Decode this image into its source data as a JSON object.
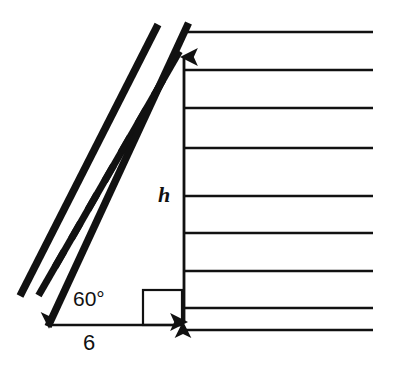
{
  "figure": {
    "kind": "geometry-diagram",
    "background_color": "#ffffff",
    "stroke_color": "#111111",
    "width": 394,
    "height": 367
  },
  "labels": {
    "angle": "60°",
    "height": "h",
    "base": "6"
  },
  "annotations": {
    "angle_name": "angle-label-60-degrees",
    "height_name": "height-label-h",
    "base_name": "base-length-label-6"
  },
  "geometry": {
    "ground_y": 325,
    "wall_x": 184,
    "ladder_foot": {
      "x": 48,
      "y": 325
    },
    "ladder_top": {
      "x": 188,
      "y": 24
    },
    "ladder_angle_degrees": 60,
    "ladder_rung_count": 8,
    "ladder_rail_width": 7,
    "right_angle_box": {
      "x": 143,
      "y": 290,
      "size": 39
    },
    "height_arrow": {
      "x": 184,
      "y_top": 57,
      "y_bottom": 322
    },
    "base_arrow": {
      "y": 325,
      "x_left": 48,
      "x_right": 184
    },
    "wall_lines": {
      "x_start": 184,
      "x_end": 373,
      "y_values": [
        32,
        70,
        108,
        148,
        196,
        233,
        271,
        308,
        330
      ]
    }
  }
}
